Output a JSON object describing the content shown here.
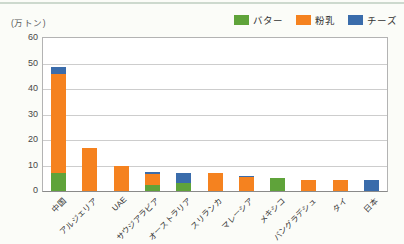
{
  "page": {
    "background": "#fbfcf8",
    "top_rule_color": "#c2cfc3"
  },
  "chart_data": {
    "type": "bar",
    "stacked": true,
    "title": "",
    "unit_label": "(万トン)",
    "xlabel": "",
    "ylabel": "",
    "categories": [
      "中国",
      "アルジェリア",
      "UAE",
      "サウジアラビア",
      "オーストラリア",
      "スリランカ",
      "マレーシア",
      "メキシコ",
      "バングラデシュ",
      "タイ",
      "日本"
    ],
    "series": [
      {
        "name": "バター",
        "color": "#5fa33a",
        "values": [
          7,
          0,
          0,
          2.5,
          3,
          0,
          0,
          5,
          0,
          0,
          0
        ]
      },
      {
        "name": "粉乳",
        "color": "#f5821f",
        "values": [
          39,
          17,
          10,
          4,
          0,
          7,
          5.5,
          0,
          4.5,
          4.5,
          0
        ]
      },
      {
        "name": "チーズ",
        "color": "#3a6cab",
        "values": [
          2.5,
          0,
          0,
          1,
          4,
          0,
          0.5,
          0,
          0,
          0,
          4.5
        ]
      }
    ],
    "totals": [
      48.5,
      17,
      10,
      7.5,
      7,
      7,
      6,
      5,
      4.5,
      4.5,
      4.5
    ],
    "ylim": [
      0,
      60
    ],
    "yticks": [
      0,
      10,
      20,
      30,
      40,
      50,
      60
    ],
    "grid": true,
    "grid_color": "#cdcdcd",
    "axis_color": "#8a8a8a",
    "legend_position": "top-right"
  }
}
